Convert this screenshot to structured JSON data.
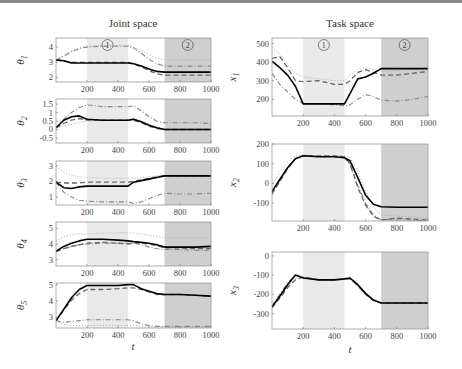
{
  "titles": {
    "left": "Joint space",
    "right": "Task space"
  },
  "xlabel": "t",
  "regions": {
    "r1": {
      "label": "1",
      "t0": 200,
      "t1": 465,
      "color": "#e9e9e9"
    },
    "r2": {
      "label": "2",
      "t0": 700,
      "t1": 1000,
      "color": "#cfcfcf"
    }
  },
  "colors": {
    "solid": "#000000",
    "dashed": "#666666",
    "dashdot": "#888888",
    "dotted": "#aaaaaa"
  },
  "chart_data": [
    {
      "type": "line",
      "panel": "theta1",
      "ylabel": "θ1",
      "ylim": [
        1.7,
        4.6
      ],
      "yticks": [
        2,
        3,
        4
      ],
      "xlim": [
        0,
        1000
      ],
      "xticks": [
        200,
        400,
        600,
        800,
        1000
      ],
      "x": [
        0,
        50,
        100,
        150,
        200,
        300,
        400,
        465,
        500,
        550,
        600,
        650,
        700,
        800,
        900,
        1000
      ],
      "series": [
        {
          "name": "solid",
          "values": [
            3.15,
            3.1,
            2.95,
            2.95,
            2.95,
            2.95,
            2.95,
            2.95,
            2.9,
            2.75,
            2.55,
            2.4,
            2.35,
            2.35,
            2.35,
            2.35
          ]
        },
        {
          "name": "dashed",
          "values": [
            3.15,
            3.1,
            3.0,
            3.0,
            3.0,
            3.0,
            3.0,
            3.0,
            2.9,
            2.7,
            2.45,
            2.25,
            2.15,
            2.15,
            2.15,
            2.15
          ]
        },
        {
          "name": "dashdot",
          "values": [
            3.15,
            3.4,
            3.7,
            3.9,
            4.0,
            4.05,
            4.05,
            4.05,
            3.95,
            3.6,
            3.2,
            2.9,
            2.75,
            2.75,
            2.75,
            2.75
          ]
        },
        {
          "name": "dotted",
          "values": [
            3.15,
            3.45,
            3.75,
            3.95,
            4.05,
            4.1,
            4.1,
            4.1,
            4.0,
            3.8,
            3.5,
            3.25,
            3.15,
            3.15,
            3.15,
            3.15
          ]
        }
      ]
    },
    {
      "type": "line",
      "panel": "theta2",
      "ylabel": "θ2",
      "ylim": [
        -0.8,
        1.8
      ],
      "yticks": [
        -0.5,
        0,
        0.5,
        1,
        1.5
      ],
      "xlim": [
        0,
        1000
      ],
      "xticks": [
        200,
        400,
        600,
        800,
        1000
      ],
      "x": [
        0,
        50,
        100,
        150,
        200,
        300,
        400,
        465,
        500,
        550,
        600,
        650,
        700,
        800,
        900,
        1000
      ],
      "series": [
        {
          "name": "solid",
          "values": [
            0.1,
            0.55,
            0.75,
            0.8,
            0.6,
            0.55,
            0.55,
            0.55,
            0.6,
            0.45,
            0.25,
            0.1,
            0.0,
            0.0,
            0.0,
            0.0
          ]
        },
        {
          "name": "dashed",
          "values": [
            0.1,
            0.35,
            0.55,
            0.65,
            0.55,
            0.55,
            0.55,
            0.55,
            0.55,
            0.4,
            0.2,
            0.05,
            0.0,
            0.0,
            0.0,
            0.0
          ]
        },
        {
          "name": "dashdot",
          "values": [
            0.1,
            0.6,
            1.0,
            1.3,
            1.45,
            1.35,
            1.35,
            1.35,
            1.4,
            1.1,
            0.75,
            0.5,
            0.4,
            0.4,
            0.4,
            0.35
          ]
        },
        {
          "name": "dotted",
          "values": [
            0.1,
            0.2,
            0.3,
            0.4,
            0.5,
            0.55,
            0.55,
            0.6,
            0.65,
            0.5,
            0.3,
            0.15,
            0.05,
            0.05,
            0.05,
            0.05
          ]
        }
      ]
    },
    {
      "type": "line",
      "panel": "theta3",
      "ylabel": "θ3",
      "ylim": [
        0.5,
        3.3
      ],
      "yticks": [
        1,
        2,
        3
      ],
      "xlim": [
        0,
        1000
      ],
      "xticks": [
        200,
        400,
        600,
        800,
        1000
      ],
      "x": [
        0,
        50,
        100,
        150,
        200,
        300,
        400,
        465,
        500,
        550,
        600,
        650,
        700,
        800,
        900,
        1000
      ],
      "series": [
        {
          "name": "solid",
          "values": [
            1.95,
            1.6,
            1.55,
            1.65,
            1.7,
            1.7,
            1.7,
            1.7,
            1.95,
            2.05,
            2.15,
            2.25,
            2.35,
            2.35,
            2.35,
            2.35
          ]
        },
        {
          "name": "dashed",
          "values": [
            1.95,
            1.9,
            1.9,
            1.9,
            1.95,
            1.95,
            1.95,
            1.95,
            2.0,
            2.1,
            2.2,
            2.3,
            2.35,
            2.35,
            2.35,
            2.35
          ]
        },
        {
          "name": "dashdot",
          "values": [
            1.95,
            1.3,
            1.0,
            0.8,
            0.75,
            0.7,
            0.7,
            0.7,
            0.6,
            0.7,
            0.9,
            1.1,
            1.25,
            1.2,
            1.2,
            1.25
          ]
        },
        {
          "name": "dotted",
          "values": [
            2.95,
            2.6,
            2.4,
            2.3,
            2.25,
            2.2,
            2.2,
            2.2,
            2.2,
            2.25,
            2.3,
            2.35,
            2.35,
            2.35,
            2.35,
            2.35
          ]
        }
      ]
    },
    {
      "type": "line",
      "panel": "theta4",
      "ylabel": "θ4",
      "ylim": [
        2.6,
        5.4
      ],
      "yticks": [
        3,
        4,
        5
      ],
      "xlim": [
        0,
        1000
      ],
      "xticks": [
        200,
        400,
        600,
        800,
        1000
      ],
      "x": [
        0,
        50,
        100,
        150,
        200,
        300,
        400,
        465,
        500,
        550,
        600,
        650,
        700,
        800,
        900,
        1000
      ],
      "series": [
        {
          "name": "solid",
          "values": [
            3.55,
            3.85,
            4.05,
            4.2,
            4.3,
            4.3,
            4.25,
            4.2,
            4.15,
            4.1,
            4.05,
            3.95,
            3.8,
            3.8,
            3.8,
            3.85
          ]
        },
        {
          "name": "dashed",
          "values": [
            3.5,
            3.7,
            3.85,
            3.95,
            4.05,
            4.1,
            4.05,
            4.0,
            4.05,
            4.05,
            4.0,
            3.9,
            3.75,
            3.75,
            3.7,
            3.7
          ]
        },
        {
          "name": "dashdot",
          "values": [
            3.55,
            3.7,
            3.85,
            3.95,
            4.0,
            4.05,
            4.05,
            4.05,
            4.05,
            3.95,
            3.8,
            3.7,
            3.65,
            3.65,
            3.6,
            3.6
          ]
        },
        {
          "name": "dotted",
          "values": [
            4.2,
            4.45,
            4.6,
            4.65,
            4.65,
            4.7,
            4.7,
            4.7,
            4.7,
            4.65,
            4.55,
            4.45,
            4.4,
            4.4,
            4.4,
            4.4
          ]
        }
      ]
    },
    {
      "type": "line",
      "panel": "theta5",
      "ylabel": "θ5",
      "ylim": [
        2.35,
        5.1
      ],
      "yticks": [
        3,
        4,
        5
      ],
      "xlim": [
        0,
        1000
      ],
      "xticks": [
        200,
        400,
        600,
        800,
        1000
      ],
      "x": [
        0,
        50,
        100,
        150,
        200,
        300,
        400,
        465,
        500,
        550,
        600,
        650,
        700,
        800,
        900,
        1000
      ],
      "series": [
        {
          "name": "solid",
          "values": [
            2.8,
            3.5,
            4.2,
            4.7,
            4.95,
            4.95,
            4.95,
            5.0,
            5.0,
            4.75,
            4.6,
            4.45,
            4.4,
            4.4,
            4.35,
            4.3
          ]
        },
        {
          "name": "dashed",
          "values": [
            2.8,
            3.45,
            4.05,
            4.45,
            4.7,
            4.7,
            4.75,
            4.8,
            4.8,
            4.7,
            4.55,
            4.4,
            4.4,
            4.4,
            4.35,
            4.3
          ]
        },
        {
          "name": "dashdot",
          "values": [
            2.8,
            2.7,
            2.75,
            2.8,
            2.85,
            2.85,
            2.85,
            2.85,
            2.8,
            2.6,
            2.5,
            2.45,
            2.45,
            2.45,
            2.45,
            2.45
          ]
        },
        {
          "name": "dotted",
          "values": [
            2.8,
            2.55,
            2.5,
            2.5,
            2.5,
            2.5,
            2.5,
            2.5,
            2.5,
            2.45,
            2.42,
            2.4,
            2.4,
            2.4,
            2.4,
            2.4
          ]
        }
      ]
    },
    {
      "type": "line",
      "panel": "x1",
      "ylabel": "x1",
      "ylim": [
        110,
        530
      ],
      "yticks": [
        200,
        300,
        400,
        500
      ],
      "xlim": [
        0,
        1000
      ],
      "xticks": [
        200,
        400,
        600,
        800,
        1000
      ],
      "x": [
        0,
        50,
        100,
        150,
        200,
        300,
        400,
        465,
        500,
        550,
        600,
        650,
        700,
        800,
        900,
        1000
      ],
      "series": [
        {
          "name": "solid",
          "values": [
            405,
            370,
            330,
            270,
            175,
            175,
            175,
            175,
            230,
            310,
            320,
            340,
            365,
            365,
            365,
            365
          ]
        },
        {
          "name": "dashed",
          "values": [
            420,
            430,
            370,
            300,
            295,
            300,
            280,
            280,
            300,
            345,
            360,
            345,
            330,
            330,
            340,
            350
          ]
        },
        {
          "name": "dashdot",
          "values": [
            340,
            280,
            240,
            200,
            175,
            175,
            170,
            165,
            170,
            200,
            225,
            215,
            195,
            190,
            200,
            215
          ]
        },
        {
          "name": "dotted",
          "values": [
            480,
            440,
            390,
            340,
            320,
            310,
            300,
            300,
            330,
            360,
            370,
            360,
            350,
            355,
            360,
            365
          ]
        }
      ]
    },
    {
      "type": "line",
      "panel": "x2",
      "ylabel": "x2",
      "ylim": [
        -190,
        200
      ],
      "yticks": [
        -100,
        0,
        100,
        200
      ],
      "xlim": [
        0,
        1000
      ],
      "xticks": [
        200,
        400,
        600,
        800,
        1000
      ],
      "x": [
        0,
        50,
        100,
        150,
        200,
        300,
        400,
        465,
        500,
        550,
        600,
        650,
        700,
        800,
        900,
        1000
      ],
      "series": [
        {
          "name": "solid",
          "values": [
            -40,
            20,
            80,
            125,
            140,
            135,
            135,
            130,
            115,
            30,
            -60,
            -105,
            -118,
            -120,
            -120,
            -120
          ]
        },
        {
          "name": "dashed",
          "values": [
            -55,
            10,
            75,
            125,
            140,
            140,
            140,
            135,
            100,
            -20,
            -110,
            -165,
            -185,
            -175,
            -180,
            -185
          ]
        },
        {
          "name": "dashdot",
          "values": [
            -45,
            15,
            80,
            125,
            140,
            135,
            135,
            130,
            95,
            -10,
            -100,
            -160,
            -185,
            -180,
            -185,
            -190
          ]
        },
        {
          "name": "dotted",
          "values": [
            -10,
            60,
            110,
            140,
            145,
            140,
            140,
            140,
            130,
            60,
            -40,
            -120,
            -160,
            -165,
            -170,
            -175
          ]
        }
      ]
    },
    {
      "type": "line",
      "panel": "x3",
      "ylabel": "x3",
      "ylim": [
        -380,
        20
      ],
      "yticks": [
        0,
        -100,
        -200,
        -300
      ],
      "xlim": [
        0,
        1000
      ],
      "xticks": [
        200,
        400,
        600,
        800,
        1000
      ],
      "x": [
        0,
        50,
        100,
        150,
        200,
        300,
        400,
        465,
        500,
        550,
        600,
        650,
        700,
        800,
        900,
        1000
      ],
      "series": [
        {
          "name": "solid",
          "values": [
            -265,
            -210,
            -150,
            -100,
            -115,
            -125,
            -125,
            -120,
            -115,
            -150,
            -195,
            -230,
            -245,
            -245,
            -245,
            -245
          ]
        },
        {
          "name": "dashed",
          "values": [
            -270,
            -220,
            -165,
            -125,
            -110,
            -125,
            -125,
            -120,
            -120,
            -155,
            -200,
            -232,
            -245,
            -245,
            -245,
            -245
          ]
        },
        {
          "name": "dashdot",
          "values": [
            -260,
            -200,
            -140,
            -100,
            -110,
            -125,
            -125,
            -120,
            -118,
            -152,
            -198,
            -232,
            -245,
            -245,
            -245,
            -245
          ]
        },
        {
          "name": "dotted",
          "values": [
            -270,
            -215,
            -160,
            -115,
            -112,
            -125,
            -125,
            -120,
            -118,
            -152,
            -198,
            -232,
            -245,
            -245,
            -245,
            -245
          ]
        }
      ]
    }
  ],
  "layout_panels": [
    {
      "id": "theta1",
      "x0": 56,
      "x1": 211,
      "y0": 38,
      "y1": 82,
      "region_labels": true
    },
    {
      "id": "theta2",
      "x0": 56,
      "x1": 211,
      "y0": 99,
      "y1": 143,
      "region_labels": false
    },
    {
      "id": "theta3",
      "x0": 56,
      "x1": 211,
      "y0": 161,
      "y1": 205,
      "region_labels": false
    },
    {
      "id": "theta4",
      "x0": 56,
      "x1": 211,
      "y0": 222,
      "y1": 266,
      "region_labels": false
    },
    {
      "id": "theta5",
      "x0": 56,
      "x1": 211,
      "y0": 283,
      "y1": 328,
      "region_labels": false
    },
    {
      "id": "x1",
      "x0": 272,
      "x1": 428,
      "y0": 38,
      "y1": 116,
      "region_labels": true
    },
    {
      "id": "x2",
      "x0": 272,
      "x1": 428,
      "y0": 144,
      "y1": 221,
      "region_labels": false
    },
    {
      "id": "x3",
      "x0": 272,
      "x1": 428,
      "y0": 252,
      "y1": 329,
      "region_labels": false
    }
  ]
}
